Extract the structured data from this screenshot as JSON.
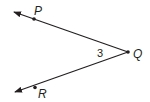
{
  "diagram": {
    "type": "angle",
    "angle_name": "angle PQR",
    "angle_number_label": "3",
    "vertex": {
      "label": "Q",
      "x": 128,
      "y": 52
    },
    "points": [
      {
        "label": "P",
        "x": 34,
        "y": 19,
        "label_x": 35,
        "label_y": 16
      },
      {
        "label": "R",
        "x": 35,
        "y": 87,
        "label_x": 37,
        "label_y": 97
      }
    ],
    "rays": [
      {
        "name": "ray QP",
        "from": "Q",
        "through": "P",
        "arrow_tip": [
          13,
          11
        ]
      },
      {
        "name": "ray QR",
        "from": "Q",
        "through": "R",
        "arrow_tip": [
          14,
          93
        ]
      }
    ],
    "colors": {
      "line": "#231f20",
      "background": "#ffffff"
    }
  }
}
